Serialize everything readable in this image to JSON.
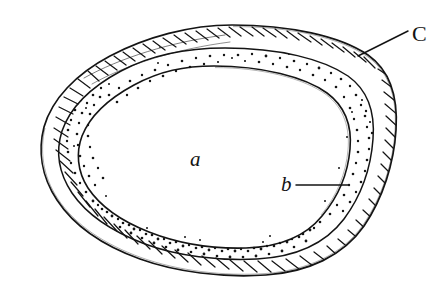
{
  "figure": {
    "background_color": "#ffffff",
    "ink_color": "#141414",
    "width": 447,
    "height": 301
  },
  "labels": [
    {
      "id": "a",
      "text": "a",
      "meaning": "inner-core-region",
      "x": 190,
      "y": 166,
      "has_leader": false
    },
    {
      "id": "b",
      "text": "b",
      "meaning": "stippled-middle-layer",
      "x": 281,
      "y": 191,
      "has_leader": true,
      "leader_from_x": 296,
      "leader_from_y": 185,
      "leader_to_x": 348,
      "leader_to_y": 185
    },
    {
      "id": "C",
      "text": "C",
      "meaning": "hatched-outer-layer",
      "x": 412,
      "y": 41,
      "has_leader": true,
      "leader_from_x": 408,
      "leader_from_y": 31,
      "leader_to_x": 358,
      "leader_to_y": 56
    }
  ],
  "layers": [
    {
      "name": "inner-core",
      "key": "a",
      "fill": "#ffffff",
      "pattern": "blank"
    },
    {
      "name": "middle-layer",
      "key": "b",
      "fill": "#ffffff",
      "pattern": "stipple"
    },
    {
      "name": "outer-layer",
      "key": "C",
      "fill": "#ffffff",
      "pattern": "hatch"
    }
  ]
}
